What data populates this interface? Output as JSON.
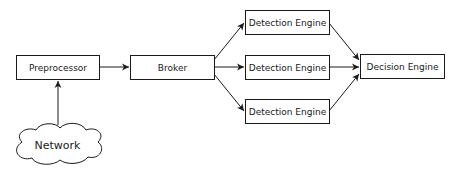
{
  "diagram": {
    "nodes": {
      "network": {
        "label": "Network",
        "shape": "cloud"
      },
      "preprocessor": {
        "label": "Preprocessor",
        "shape": "rect"
      },
      "broker": {
        "label": "Broker",
        "shape": "rect"
      },
      "detection_1": {
        "label": "Detection Engine",
        "shape": "rect"
      },
      "detection_2": {
        "label": "Detection Engine",
        "shape": "rect"
      },
      "detection_3": {
        "label": "Detection Engine",
        "shape": "rect"
      },
      "decision": {
        "label": "Decision Engine",
        "shape": "rect"
      }
    },
    "edges": [
      {
        "from": "network",
        "to": "preprocessor"
      },
      {
        "from": "preprocessor",
        "to": "broker"
      },
      {
        "from": "broker",
        "to": "detection_1"
      },
      {
        "from": "broker",
        "to": "detection_2"
      },
      {
        "from": "broker",
        "to": "detection_3"
      },
      {
        "from": "detection_1",
        "to": "decision"
      },
      {
        "from": "detection_2",
        "to": "decision"
      },
      {
        "from": "detection_3",
        "to": "decision"
      }
    ],
    "colors": {
      "stroke": "#1a1a1a",
      "fill": "#ffffff"
    }
  }
}
